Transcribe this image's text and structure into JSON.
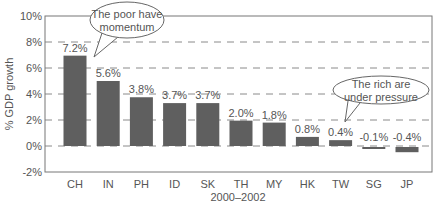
{
  "chart_data": {
    "type": "bar",
    "title": "",
    "xlabel": "2000–2002",
    "ylabel": "% GDP growth",
    "ylim": [
      -2,
      10
    ],
    "yticks": [
      "10%",
      "8%",
      "6%",
      "4%",
      "2%",
      "0%",
      "-2%"
    ],
    "ytick_values": [
      10,
      8,
      6,
      4,
      2,
      0,
      -2
    ],
    "grid": "dashed horizontal at 0%, 2%, 4%, 6%, 8%",
    "legend": "none",
    "categories": [
      "CH",
      "IN",
      "PH",
      "ID",
      "SK",
      "TH",
      "MY",
      "HK",
      "TW",
      "SG",
      "JP"
    ],
    "values": [
      7.2,
      5.6,
      3.8,
      3.7,
      3.7,
      2.0,
      1.8,
      0.8,
      0.4,
      -0.1,
      -0.4
    ],
    "value_labels": [
      "7.2%",
      "5.6%",
      "3.8%",
      "3.7%",
      "3.7%",
      "2.0%",
      "1.8%",
      "0.8%",
      "0.4%",
      "-0.1%",
      "-0.4%"
    ],
    "bar_heights_drawn": [
      6.95,
      5.0,
      3.75,
      3.3,
      3.3,
      1.95,
      1.8,
      0.7,
      0.45,
      -0.15,
      -0.4
    ],
    "annotations": [
      {
        "text_lines": [
          "The poor have",
          "momentum"
        ],
        "points_to": "CH"
      },
      {
        "text_lines": [
          "The rich are",
          "under pressure"
        ],
        "points_to": "TW"
      }
    ],
    "colors": {
      "bar": "#5f5f5f",
      "grid": "#8a8a8a",
      "axis": "#777777",
      "text": "#555555"
    }
  }
}
